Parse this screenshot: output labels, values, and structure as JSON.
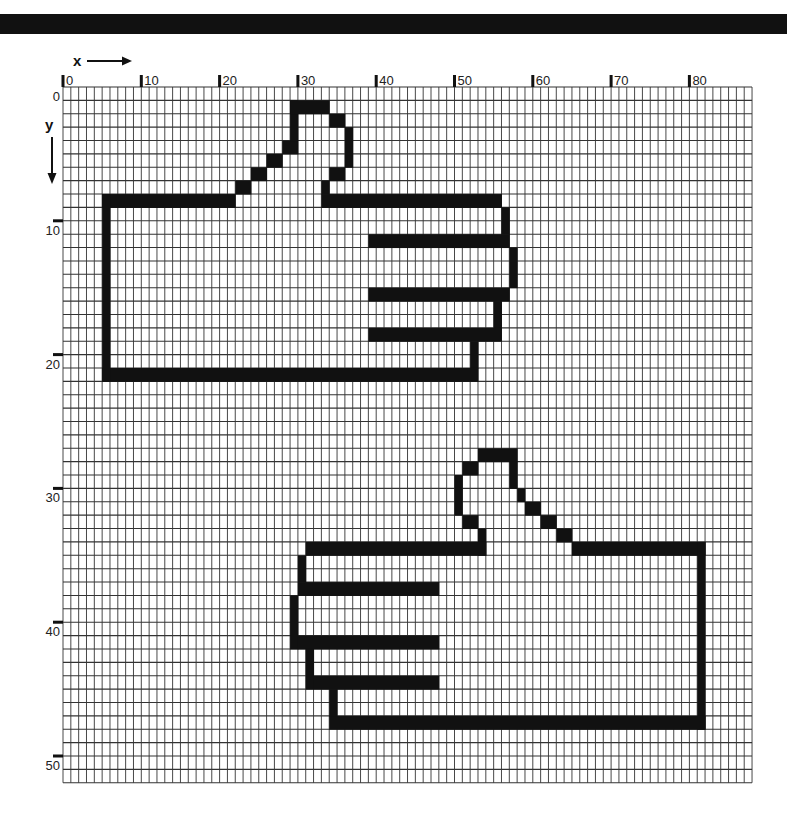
{
  "figure": {
    "title": "",
    "x_axis": {
      "label": "x",
      "ticks": [
        "0",
        "10",
        "20",
        "30",
        "40",
        "50",
        "60",
        "70",
        "80"
      ]
    },
    "y_axis": {
      "label": "y",
      "ticks": [
        "0",
        "10",
        "20",
        "30",
        "40",
        "50"
      ]
    },
    "grid": {
      "columns": 88,
      "rows": 52,
      "origin_px": [
        63,
        87
      ],
      "cell_px": [
        7.83,
        13.38
      ]
    },
    "colors": {
      "ink": "#111111",
      "grid": "#333333",
      "background": "#ffffff"
    },
    "shapes": [
      {
        "name": "thumbs-up-hand-top",
        "cells": [
          [
            5,
            8,
            17,
            1
          ],
          [
            22,
            7,
            2,
            1
          ],
          [
            24,
            6,
            2,
            1
          ],
          [
            26,
            5,
            2,
            1
          ],
          [
            28,
            4,
            2,
            1
          ],
          [
            29,
            1,
            1,
            3
          ],
          [
            29,
            1,
            5,
            1
          ],
          [
            34,
            2,
            2,
            1
          ],
          [
            36,
            3,
            1,
            3
          ],
          [
            34,
            6,
            2,
            1
          ],
          [
            33,
            7,
            1,
            1
          ],
          [
            33,
            8,
            23,
            1
          ],
          [
            56,
            9,
            1,
            2
          ],
          [
            39,
            11,
            18,
            1
          ],
          [
            57,
            12,
            1,
            3
          ],
          [
            39,
            15,
            18,
            1
          ],
          [
            55,
            16,
            1,
            2
          ],
          [
            39,
            18,
            17,
            1
          ],
          [
            52,
            19,
            1,
            2
          ],
          [
            5,
            21,
            48,
            1
          ],
          [
            5,
            8,
            1,
            14
          ]
        ]
      },
      {
        "name": "thumbs-up-hand-bottom",
        "cells": [
          [
            53,
            27,
            5,
            1
          ],
          [
            51,
            28,
            2,
            1
          ],
          [
            50,
            29,
            1,
            3
          ],
          [
            51,
            32,
            2,
            1
          ],
          [
            53,
            33,
            1,
            2
          ],
          [
            57,
            28,
            1,
            2
          ],
          [
            58,
            30,
            1,
            1
          ],
          [
            59,
            31,
            2,
            1
          ],
          [
            61,
            32,
            2,
            1
          ],
          [
            63,
            33,
            2,
            1
          ],
          [
            65,
            34,
            17,
            1
          ],
          [
            31,
            34,
            23,
            1
          ],
          [
            81,
            34,
            1,
            14
          ],
          [
            34,
            47,
            48,
            1
          ],
          [
            30,
            35,
            1,
            2
          ],
          [
            30,
            37,
            18,
            1
          ],
          [
            29,
            38,
            1,
            4
          ],
          [
            30,
            41,
            18,
            1
          ],
          [
            31,
            42,
            1,
            3
          ],
          [
            32,
            44,
            16,
            1
          ],
          [
            34,
            45,
            1,
            2
          ]
        ]
      }
    ]
  },
  "chart_data": {
    "type": "table",
    "title": "",
    "xlabel": "x",
    "ylabel": "y",
    "x_ticks": [
      0,
      10,
      20,
      30,
      40,
      50,
      60,
      70,
      80
    ],
    "y_ticks": [
      0,
      10,
      20,
      30,
      40,
      50
    ],
    "xlim": [
      0,
      88
    ],
    "ylim": [
      0,
      52
    ],
    "y_direction": "down",
    "grid": true,
    "shapes": [
      {
        "name": "hand (pointing right, thumb up)",
        "bbox_cells": {
          "x": [
            5,
            57
          ],
          "y": [
            1,
            21
          ]
        }
      },
      {
        "name": "hand (pointing left, thumb up)",
        "bbox_cells": {
          "x": [
            29,
            81
          ],
          "y": [
            27,
            47
          ]
        }
      }
    ]
  }
}
